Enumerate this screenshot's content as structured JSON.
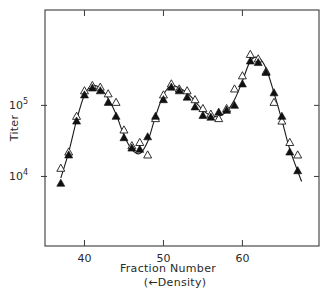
{
  "chart_data": {
    "type": "scatter",
    "title": "",
    "xlabel": "Fraction  Number",
    "xlabel_sub": "(←Density)",
    "ylabel": "Titer",
    "yscale": "log",
    "xlim": [
      35,
      69.7
    ],
    "ylim": [
      1050,
      2200000
    ],
    "x_ticks": [
      40,
      50,
      60
    ],
    "x_tick_labels": [
      "40",
      "50",
      "60"
    ],
    "y_ticks": [
      10000,
      100000
    ],
    "y_tick_labels": [
      "10",
      "10"
    ],
    "y_tick_exponents": [
      "4",
      "5"
    ],
    "grid": false,
    "legend": null,
    "series": [
      {
        "name": "open triangles",
        "marker": "open-triangle",
        "x": [
          37,
          38,
          39,
          40,
          41,
          42,
          43,
          44,
          45,
          46,
          47,
          48,
          49,
          50,
          51,
          52,
          53,
          54,
          55,
          56,
          57,
          58,
          59,
          60,
          61,
          62,
          63,
          64,
          65,
          66,
          67
        ],
        "values": [
          13000,
          22000,
          70000,
          160000,
          190000,
          180000,
          145000,
          110000,
          45000,
          27000,
          30000,
          20000,
          65000,
          140000,
          200000,
          170000,
          160000,
          120000,
          90000,
          75000,
          65000,
          90000,
          170000,
          260000,
          520000,
          450000,
          300000,
          110000,
          60000,
          30000,
          20000
        ],
        "color": "#ffffff"
      },
      {
        "name": "filled triangles",
        "marker": "filled-triangle",
        "x": [
          37,
          38,
          39,
          40,
          41,
          42,
          43,
          44,
          45,
          46,
          47,
          48,
          49,
          50,
          51,
          52,
          53,
          54,
          55,
          56,
          57,
          58,
          59,
          60,
          61,
          62,
          63,
          64,
          65,
          66,
          67
        ],
        "values": [
          8000,
          20000,
          60000,
          140000,
          175000,
          160000,
          110000,
          70000,
          35000,
          25000,
          24000,
          36000,
          70000,
          120000,
          180000,
          160000,
          130000,
          95000,
          72000,
          68000,
          80000,
          85000,
          100000,
          200000,
          420000,
          400000,
          290000,
          150000,
          70000,
          22000,
          12000
        ],
        "color": "#111111"
      }
    ],
    "fitted_curve": {
      "x": [
        37,
        38,
        39,
        40,
        41,
        42,
        43,
        44,
        45,
        46,
        47,
        48,
        49,
        50,
        51,
        52,
        53,
        54,
        55,
        56,
        57,
        58,
        59,
        60,
        61,
        62,
        63,
        64,
        65,
        66,
        67.5
      ],
      "values": [
        9500,
        22000,
        62000,
        140000,
        190000,
        175000,
        125000,
        75000,
        38000,
        24000,
        21000,
        31000,
        70000,
        140000,
        190000,
        175000,
        150000,
        115000,
        85000,
        72000,
        70000,
        82000,
        120000,
        220000,
        420000,
        470000,
        330000,
        150000,
        62000,
        24000,
        8500
      ]
    }
  }
}
